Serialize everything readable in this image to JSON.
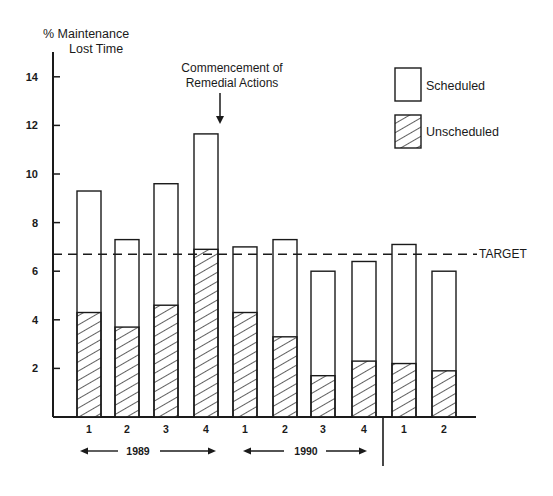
{
  "chart_data": {
    "type": "bar",
    "stacked": true,
    "title": "",
    "ylabel": "% Maintenance Lost Time",
    "ylabel_lines": [
      "%  Maintenance",
      "Lost Time"
    ],
    "xlabel": "",
    "ylim": [
      0,
      15
    ],
    "yticks": [
      2,
      4,
      6,
      8,
      10,
      12,
      14
    ],
    "grid": false,
    "categories": [
      "1989 Q1",
      "1989 Q2",
      "1989 Q3",
      "1989 Q4",
      "1990 Q1",
      "1990 Q2",
      "1990 Q3",
      "1990 Q4",
      "1991 Q1",
      "1991 Q2"
    ],
    "tick_labels": [
      "1",
      "2",
      "3",
      "4",
      "1",
      "2",
      "3",
      "4",
      "1",
      "2"
    ],
    "series": [
      {
        "name": "Unscheduled",
        "pattern": "hatched",
        "values": [
          4.3,
          3.7,
          4.6,
          6.9,
          4.3,
          3.3,
          1.7,
          2.3,
          2.2,
          1.9
        ]
      },
      {
        "name": "Scheduled",
        "pattern": "open",
        "values": [
          5.0,
          3.6,
          5.0,
          4.75,
          2.7,
          4.0,
          4.3,
          4.1,
          4.9,
          4.1
        ]
      }
    ],
    "totals": [
      9.3,
      7.3,
      9.6,
      11.65,
      7.0,
      7.3,
      6.0,
      6.4,
      7.1,
      6.0
    ],
    "target": {
      "label": "TARGET",
      "value": 6.7
    },
    "annotation": {
      "lines": [
        "Commencement of",
        "Remedial Actions"
      ],
      "points_to_index": 3
    },
    "year_groups": [
      {
        "label": "1989",
        "start_index": 0,
        "end_index": 3
      },
      {
        "label": "1990",
        "start_index": 4,
        "end_index": 7
      }
    ],
    "separator_after_index": 7,
    "legend": {
      "position": "top-right",
      "items": [
        {
          "label": "Scheduled",
          "pattern": "open"
        },
        {
          "label": "Unscheduled",
          "pattern": "hatched"
        }
      ]
    }
  },
  "layout": {
    "origin_x": 53,
    "baseline_y": 417,
    "px_per_unit": 24.3,
    "axis_top_y": 52,
    "axis_end_x": 476,
    "bar_lefts": [
      77,
      115,
      154,
      194,
      233,
      273,
      311,
      352,
      392,
      432
    ],
    "bar_width": 24,
    "stroke": "#1a1a1a"
  }
}
